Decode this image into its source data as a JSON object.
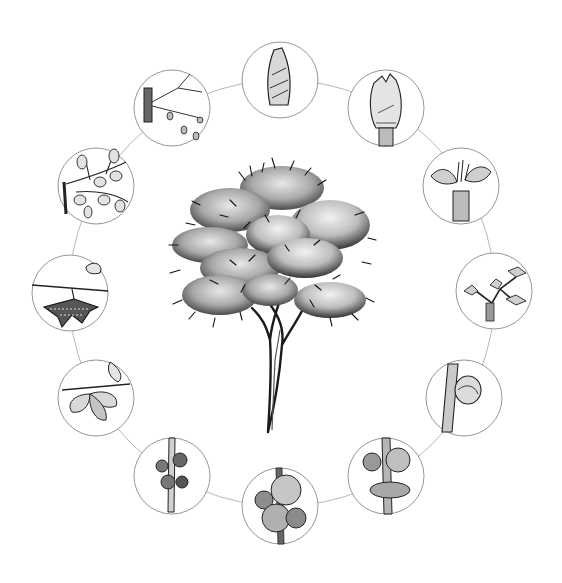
{
  "title": "",
  "diagram": {
    "type": "cycle",
    "center": {
      "x": 282,
      "y": 293
    },
    "ring_radius": 213,
    "node_radius": 38,
    "ring_color": "#b0b0b0",
    "node_stroke": "#8a8a8a",
    "center_illustration": "deciduous-tree",
    "stages": [
      {
        "id": 1,
        "angle": 0,
        "label": "dormant-bud"
      },
      {
        "id": 2,
        "angle": 30,
        "label": "bud-swelling"
      },
      {
        "id": 3,
        "angle": 60,
        "label": "bud-break-leaves-emerging"
      },
      {
        "id": 4,
        "angle": 90,
        "label": "young-shoot-with-leaves"
      },
      {
        "id": 5,
        "angle": 120,
        "label": "flower-bud-on-stem"
      },
      {
        "id": 6,
        "angle": 150,
        "label": "flowers-opening"
      },
      {
        "id": 7,
        "angle": 180,
        "label": "full-bloom"
      },
      {
        "id": 8,
        "angle": 210,
        "label": "fruit-set-clusters"
      },
      {
        "id": 9,
        "angle": 240,
        "label": "winged-seeds-with-leaves"
      },
      {
        "id": 10,
        "angle": 270,
        "label": "mature-samara-seeds"
      },
      {
        "id": 11,
        "angle": 300,
        "label": "summer-foliage-branch"
      },
      {
        "id": 12,
        "angle": 330,
        "label": "leaf-fall-bare-twig"
      }
    ]
  }
}
